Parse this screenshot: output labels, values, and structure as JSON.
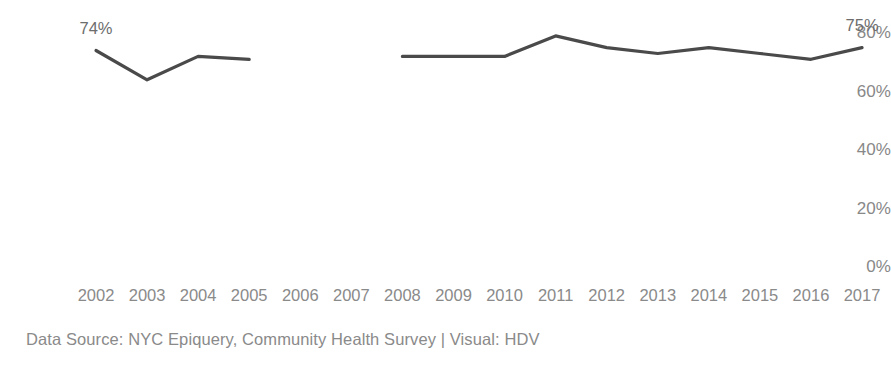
{
  "chart_data": {
    "type": "line",
    "title": "",
    "xlabel": "",
    "ylabel": "",
    "grid": false,
    "legend": "none",
    "ylim": [
      0,
      80
    ],
    "ytick_labels": [
      "0%",
      "20%",
      "40%",
      "60%",
      "80%"
    ],
    "ytick_values": [
      0,
      20,
      40,
      60,
      80
    ],
    "categories": [
      "2002",
      "2003",
      "2004",
      "2005",
      "2006",
      "2007",
      "2008",
      "2009",
      "2010",
      "2011",
      "2012",
      "2013",
      "2014",
      "2015",
      "2016",
      "2017"
    ],
    "x": [
      2002,
      2003,
      2004,
      2005,
      2006,
      2007,
      2008,
      2009,
      2010,
      2011,
      2012,
      2013,
      2014,
      2015,
      2016,
      2017
    ],
    "series": [
      {
        "name": "Percent",
        "values": [
          74,
          64,
          72,
          71,
          null,
          null,
          72,
          72,
          72,
          79,
          75,
          73,
          75,
          73,
          71,
          75
        ],
        "color": "#4a4a4a"
      }
    ],
    "annotations": [
      {
        "name": "start-value-label",
        "text": "74%",
        "x": 2002,
        "y": 74
      },
      {
        "name": "end-value-label",
        "text": "75%",
        "x": 2017,
        "y": 75
      }
    ]
  },
  "footer": {
    "source_note": "Data Source: NYC Epiquery, Community Health Survey  |  Visual: HDV"
  },
  "colors": {
    "line": "#4a4a4a",
    "axis_text": "#8a8a8a",
    "label_text": "#6d6d6d",
    "background": "#ffffff"
  }
}
